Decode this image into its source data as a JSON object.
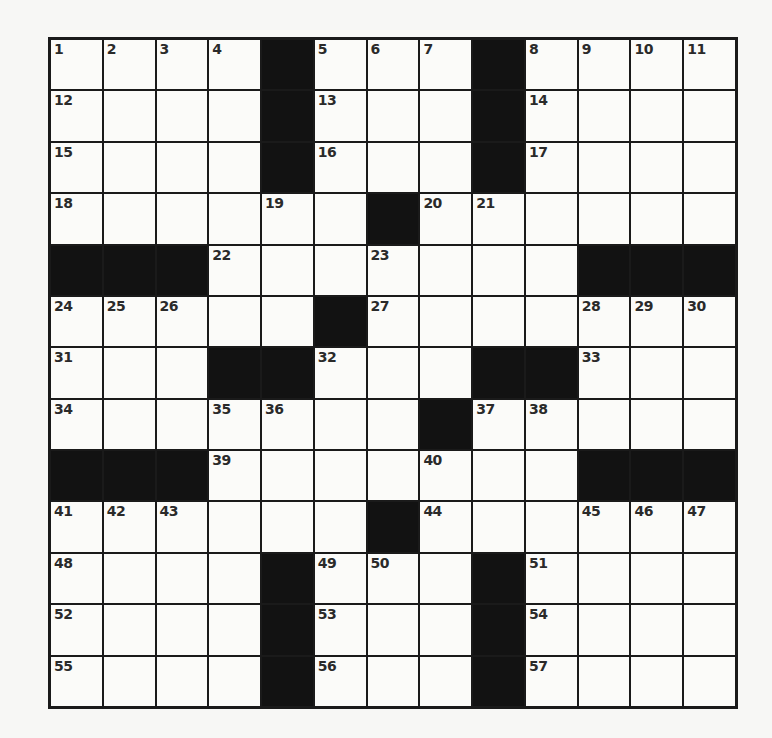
{
  "puzzle": {
    "size": {
      "rows": 13,
      "cols": 13
    },
    "pattern": [
      "....#...#....",
      "....#...#....",
      "....#...#....",
      "......#......",
      "###.......###",
      ".....#.......",
      "...##...##...",
      ".......#.....",
      "###.......###",
      "......#......",
      "....#...#....",
      "....#...#....",
      "....#...#...."
    ],
    "numbers": [
      [
        1,
        2,
        3,
        4,
        0,
        5,
        6,
        7,
        0,
        8,
        9,
        10,
        11
      ],
      [
        12,
        0,
        0,
        0,
        0,
        13,
        0,
        0,
        0,
        14,
        0,
        0,
        0
      ],
      [
        15,
        0,
        0,
        0,
        0,
        16,
        0,
        0,
        0,
        17,
        0,
        0,
        0
      ],
      [
        18,
        0,
        0,
        0,
        19,
        0,
        0,
        20,
        21,
        0,
        0,
        0,
        0
      ],
      [
        0,
        0,
        0,
        22,
        0,
        0,
        23,
        0,
        0,
        0,
        0,
        0,
        0
      ],
      [
        24,
        25,
        26,
        0,
        0,
        0,
        27,
        0,
        0,
        0,
        28,
        29,
        30
      ],
      [
        31,
        0,
        0,
        0,
        0,
        32,
        0,
        0,
        0,
        0,
        33,
        0,
        0
      ],
      [
        34,
        0,
        0,
        35,
        36,
        0,
        0,
        0,
        37,
        38,
        0,
        0,
        0
      ],
      [
        0,
        0,
        0,
        39,
        0,
        0,
        0,
        40,
        0,
        0,
        0,
        0,
        0
      ],
      [
        41,
        42,
        43,
        0,
        0,
        0,
        0,
        44,
        0,
        0,
        45,
        46,
        47
      ],
      [
        48,
        0,
        0,
        0,
        0,
        49,
        50,
        0,
        0,
        51,
        0,
        0,
        0
      ],
      [
        52,
        0,
        0,
        0,
        0,
        53,
        0,
        0,
        0,
        54,
        0,
        0,
        0
      ],
      [
        55,
        0,
        0,
        0,
        0,
        56,
        0,
        0,
        0,
        57,
        0,
        0,
        0
      ]
    ],
    "letters": [],
    "colors": {
      "block": "#121212",
      "cell": "#fbfbf9",
      "border": "#1a1a1a",
      "number": "#2a2a2a"
    }
  }
}
